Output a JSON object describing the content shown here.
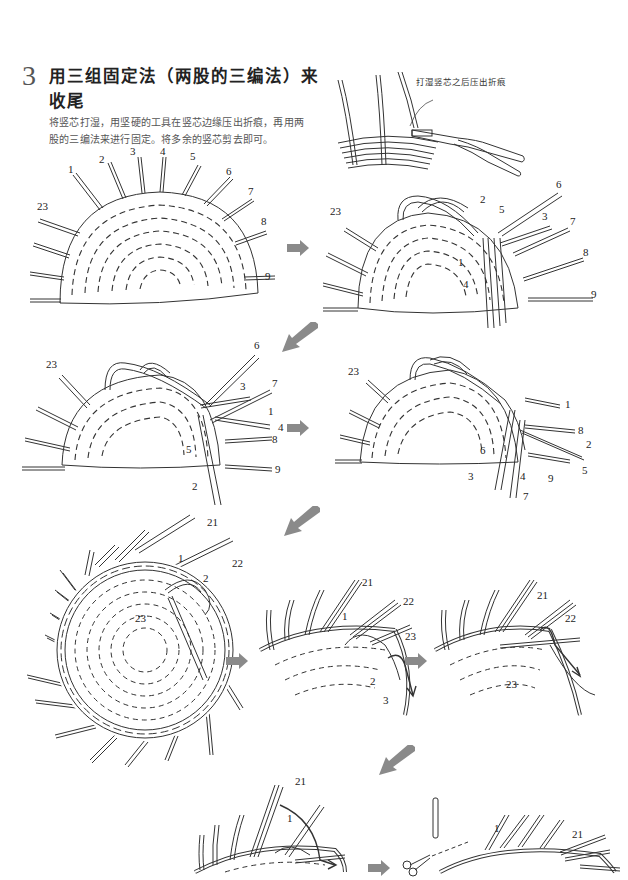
{
  "step": {
    "number": "3",
    "title": "用三组固定法（两股的三编法）来收尾",
    "description": "将竖芯打湿，用坚硬的工具在竖芯边缘压出折痕，再用两股的三编法来进行固定。将多余的竖芯剪去即可。"
  },
  "colors": {
    "arrow": "#8a8a8a",
    "line": "#333333",
    "text": "#222222",
    "desc_text": "#555555"
  },
  "figures": {
    "pliers": {
      "callout": "打湿竖芯之后压出折痕",
      "icon": "pliers-icon"
    },
    "fig1": {
      "labels": [
        "1",
        "2",
        "3",
        "4",
        "5",
        "6",
        "7",
        "8",
        "9",
        "23"
      ]
    },
    "fig2": {
      "labels": [
        "23",
        "2",
        "5",
        "6",
        "3",
        "7",
        "1",
        "8",
        "4",
        "9"
      ]
    },
    "fig3": {
      "labels": [
        "6",
        "23",
        "3",
        "7",
        "1",
        "4",
        "8",
        "5",
        "9",
        "2"
      ]
    },
    "fig4": {
      "labels": [
        "23",
        "1",
        "8",
        "2",
        "6",
        "5",
        "9",
        "3",
        "4",
        "7"
      ]
    },
    "fig5": {
      "labels": [
        "21",
        "22",
        "1",
        "2",
        "23"
      ]
    },
    "fig6": {
      "labels": [
        "21",
        "22",
        "1",
        "23",
        "2",
        "3"
      ]
    },
    "fig7": {
      "labels": [
        "21",
        "22",
        "23"
      ]
    },
    "fig8": {
      "labels": [
        "21",
        "1"
      ]
    },
    "fig9": {
      "labels": [
        "1",
        "21"
      ],
      "icon": "scissors-icon"
    }
  },
  "arrows": [
    {
      "id": "arrow-right-1",
      "direction": "right"
    },
    {
      "id": "arrow-down-left-1",
      "direction": "down-left"
    },
    {
      "id": "arrow-right-2",
      "direction": "right"
    },
    {
      "id": "arrow-down-left-2",
      "direction": "down-left"
    },
    {
      "id": "arrow-right-3",
      "direction": "right"
    },
    {
      "id": "arrow-right-4",
      "direction": "right"
    },
    {
      "id": "arrow-down-left-3",
      "direction": "down-left"
    },
    {
      "id": "arrow-right-5",
      "direction": "right"
    }
  ]
}
